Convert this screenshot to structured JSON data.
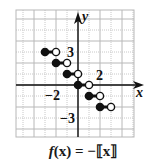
{
  "chart_data": {
    "type": "line",
    "subtype": "step-function",
    "title": "f(x) = −⟦x⟧",
    "xlabel": "x",
    "ylabel": "y",
    "xlim": [
      -5.5,
      5
    ],
    "ylim": [
      -4.7,
      6.9
    ],
    "grid": true,
    "tick_labels": [
      {
        "axis": "x",
        "value": -2,
        "label": "−2"
      },
      {
        "axis": "y",
        "value": 3,
        "label": "3"
      },
      {
        "axis": "y",
        "value": 2,
        "label": "2"
      },
      {
        "axis": "y",
        "value": -3,
        "label": "−3"
      }
    ],
    "segments": [
      {
        "x_start": -3,
        "x_end": -2,
        "y": 3,
        "start_closed": true,
        "end_closed": false
      },
      {
        "x_start": -2,
        "x_end": -1,
        "y": 2,
        "start_closed": true,
        "end_closed": false
      },
      {
        "x_start": -1,
        "x_end": 0,
        "y": 1,
        "start_closed": true,
        "end_closed": false
      },
      {
        "x_start": 0,
        "x_end": 1,
        "y": 0,
        "start_closed": true,
        "end_closed": false
      },
      {
        "x_start": 1,
        "x_end": 2,
        "y": -1,
        "start_closed": true,
        "end_closed": false
      },
      {
        "x_start": 2,
        "x_end": 3,
        "y": -2,
        "start_closed": true,
        "end_closed": false
      }
    ]
  },
  "labels": {
    "x_axis": "x",
    "y_axis": "y",
    "caption_f": "f",
    "caption_rest": "(x) = −⟦x⟧"
  },
  "colors": {
    "ink": "#111111",
    "grid_major": "#b8b8b8",
    "grid_minor": "#c8c8c8"
  }
}
